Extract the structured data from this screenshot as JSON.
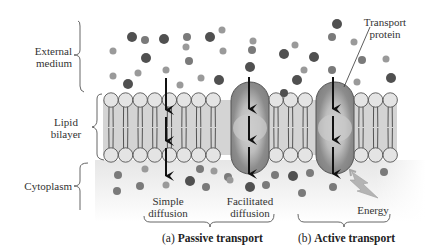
{
  "figure": {
    "regions": {
      "external": {
        "line1": "External",
        "line2": "medium"
      },
      "bilayer": {
        "line1": "Lipid",
        "line2": "bilayer"
      },
      "cytoplasm": {
        "line1": "Cytoplasm"
      }
    },
    "transport_protein": {
      "line1": "Transport",
      "line2": "protein"
    },
    "mechanisms": {
      "simple": {
        "line1": "Simple",
        "line2": "diffusion"
      },
      "facilitated": {
        "line1": "Facilitated",
        "line2": "diffusion"
      },
      "energy": "Energy"
    },
    "captions": {
      "a_letter": "(a)",
      "a_label": "Passive transport",
      "b_letter": "(b)",
      "b_label": "Active transport"
    },
    "colors": {
      "molecule_dark": "#505050",
      "molecule_mid": "#7a7a7a",
      "molecule_light": "#9a9a9a",
      "lipid_head": "#e2e2e2",
      "bilayer_fill": "#cfcfcf",
      "protein": "#8a8a8a",
      "protein_channel": "#c8c8c8",
      "energy_bolt": "#b0b0b0",
      "cytoplasm_bg": "#ececec"
    }
  }
}
